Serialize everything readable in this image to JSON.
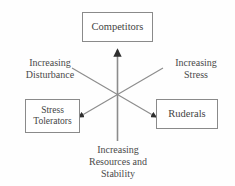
{
  "diagram": {
    "background_color": "#fefefe",
    "line_color": "#7a7a7a",
    "text_color": "#444444",
    "box_border_color": "#8a8a8a",
    "nodes": [
      {
        "id": "competitors",
        "label": "Competitors",
        "position": "top"
      },
      {
        "id": "stress-tolerators",
        "label_line1": "Stress",
        "label_line2": "Tolerators",
        "position": "bottom-left"
      },
      {
        "id": "ruderals",
        "label": "Ruderals",
        "position": "bottom-right"
      }
    ],
    "axes": [
      {
        "id": "disturbance",
        "line1": "Increasing",
        "line2": "Disturbance",
        "direction": "upper-left",
        "arrow_points_to": "stress-tolerators"
      },
      {
        "id": "stress",
        "line1": "Increasing",
        "line2": "Stress",
        "direction": "upper-right",
        "arrow_points_to": "ruderals"
      },
      {
        "id": "resources",
        "line1": "Increasing",
        "line2": "Resources and",
        "line3": "Stability",
        "direction": "bottom",
        "arrow_points_to": "competitors"
      }
    ]
  }
}
